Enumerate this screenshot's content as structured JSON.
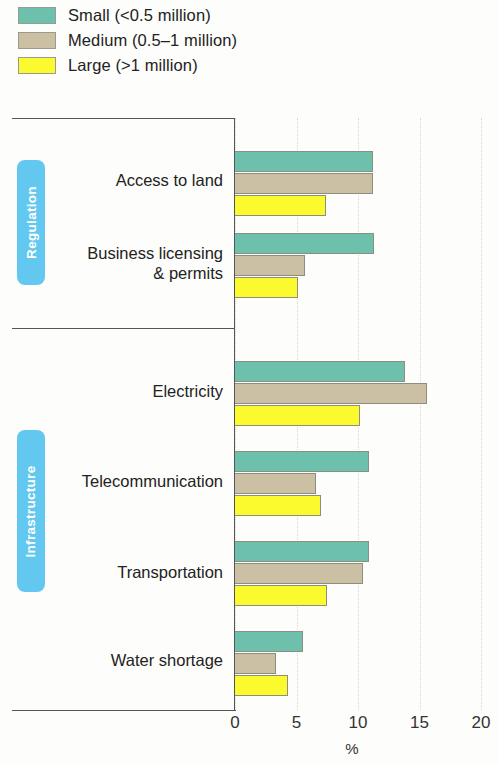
{
  "legend": {
    "items": [
      {
        "label": "Small (<0.5 million)",
        "color": "#6cc0ac",
        "key": "small"
      },
      {
        "label": "Medium (0.5–1 million)",
        "color": "#cbc0a4",
        "key": "medium"
      },
      {
        "label": "Large (>1 million)",
        "color": "#fafa2e",
        "key": "large"
      }
    ]
  },
  "groups": [
    {
      "name": "Regulation"
    },
    {
      "name": "Infrastructure"
    }
  ],
  "axis": {
    "ticks": [
      "0",
      "5",
      "10",
      "15",
      "20"
    ],
    "tick_values": [
      0,
      5,
      10,
      15,
      20
    ],
    "title": "%"
  },
  "chart_data": {
    "type": "bar",
    "orientation": "horizontal",
    "title": "",
    "xlabel": "%",
    "ylabel": "",
    "xlim": [
      0,
      20
    ],
    "grid": true,
    "legend_position": "top-left",
    "group_labels": [
      "Regulation",
      "Infrastructure"
    ],
    "group_members": {
      "Regulation": [
        "Access to land",
        "Business licensing & permits"
      ],
      "Infrastructure": [
        "Electricity",
        "Telecommunication",
        "Transportation",
        "Water shortage"
      ]
    },
    "categories": [
      "Access to land",
      "Business licensing & permits",
      "Electricity",
      "Telecommunication",
      "Transportation",
      "Water shortage"
    ],
    "series": [
      {
        "name": "Small (<0.5 million)",
        "color": "#6cc0ac",
        "values": [
          11.2,
          11.3,
          13.8,
          10.9,
          10.9,
          5.5
        ]
      },
      {
        "name": "Medium (0.5–1 million)",
        "color": "#cbc0a4",
        "values": [
          11.2,
          5.7,
          15.6,
          6.6,
          10.4,
          3.3
        ]
      },
      {
        "name": "Large (>1 million)",
        "color": "#fafa2e",
        "values": [
          7.4,
          5.1,
          10.2,
          7.0,
          7.5,
          4.3
        ]
      }
    ]
  },
  "colors": {
    "small": "#6cc0ac",
    "medium": "#cbc0a4",
    "large": "#fafa2e",
    "badge": "#63c8ef",
    "frame": "#555555",
    "gridline": "#d9d9d2"
  }
}
